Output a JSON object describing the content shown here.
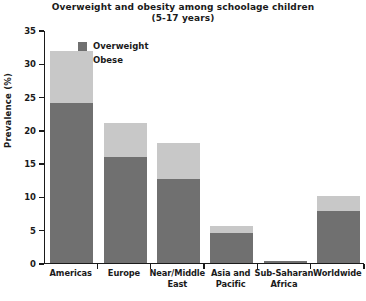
{
  "chart_data": {
    "type": "bar",
    "stacked": true,
    "title": "Overweight and obesity among schoolage children",
    "subtitle": "(5-17 years)",
    "xlabel": "",
    "ylabel": "Prevalence (%)",
    "ylim": [
      0,
      35
    ],
    "yticks": [
      0,
      5,
      10,
      15,
      20,
      25,
      30,
      35
    ],
    "ytick_labels": [
      "0",
      "5",
      "10",
      "15",
      "20",
      "25",
      "30",
      "35"
    ],
    "grid": false,
    "legend_position": "upper-left-inside",
    "categories": [
      "Americas",
      "Europe",
      "Near/Middle East",
      "Asia and Pacific",
      "Sub-Saharan Africa",
      "Worldwide"
    ],
    "category_lines": [
      [
        "Americas"
      ],
      [
        "Europe"
      ],
      [
        "Near/Middle",
        "East"
      ],
      [
        "Asia and",
        "Pacific"
      ],
      [
        "Sub-Saharan",
        "Africa"
      ],
      [
        "Worldwide"
      ]
    ],
    "series": [
      {
        "name": "Overweight",
        "color": "#707070",
        "values": [
          24.0,
          15.8,
          12.5,
          4.5,
          0.3,
          7.8
        ]
      },
      {
        "name": "Obese",
        "color": "#c8c8c8",
        "values": [
          7.8,
          5.2,
          5.5,
          1.0,
          0.0,
          2.2
        ]
      }
    ],
    "totals": [
      31.8,
      21.0,
      18.0,
      5.5,
      0.3,
      10.0
    ]
  },
  "legend": {
    "items": [
      {
        "label": "Overweight",
        "color": "#707070"
      },
      {
        "label": "Obese",
        "color": "#c8c8c8"
      }
    ]
  },
  "colors": {
    "overweight": "#707070",
    "obese": "#c8c8c8",
    "axis": "#1a1a1a",
    "background": "#ffffff"
  }
}
